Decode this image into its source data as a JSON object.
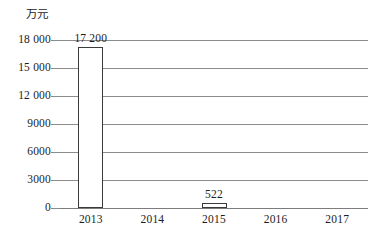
{
  "chart_data": {
    "type": "bar",
    "title": "",
    "subtitle": "",
    "xlabel": "",
    "ylabel": "万元",
    "unit_label": "万元",
    "categories": [
      "2013",
      "2014",
      "2015",
      "2016",
      "2017"
    ],
    "values": [
      17200,
      0,
      522,
      0,
      0
    ],
    "data_labels": [
      "17 200",
      "",
      "522",
      "",
      ""
    ],
    "series": [
      {
        "name": "",
        "values": [
          17200,
          0,
          522,
          0,
          0
        ]
      }
    ],
    "ylim": [
      0,
      18000
    ],
    "yticks": [
      0,
      3000,
      6000,
      9000,
      12000,
      15000,
      18000
    ],
    "ytick_labels": [
      "0",
      "3000",
      "6000",
      "9000",
      "12 000",
      "15 000",
      "18 000"
    ],
    "grid": true,
    "grid_axis": "y",
    "legend": false,
    "legend_position": "none",
    "bar_fill_color": "#ffffff",
    "bar_border_color": "#3a3a3a",
    "gridline_color": "#8c8c8c",
    "text_color": "#1c1c1c",
    "background_color": "#ffffff"
  }
}
